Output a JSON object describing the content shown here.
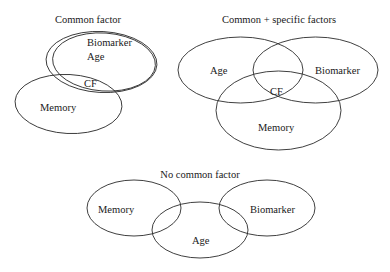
{
  "diagrams": [
    {
      "title": "Common factor",
      "sets": {
        "biomarker": "Biomarker",
        "age": "Age",
        "cf": "CF",
        "memory": "Memory"
      }
    },
    {
      "title": "Common + specific factors",
      "sets": {
        "age": "Age",
        "biomarker": "Biomarker",
        "cf": "CF",
        "memory": "Memory"
      }
    },
    {
      "title": "No common factor",
      "sets": {
        "memory": "Memory",
        "biomarker": "Biomarker",
        "age": "Age"
      }
    }
  ],
  "colors": {
    "stroke": "#2a2a2a",
    "text": "#1a1a1a",
    "background": "#ffffff"
  }
}
